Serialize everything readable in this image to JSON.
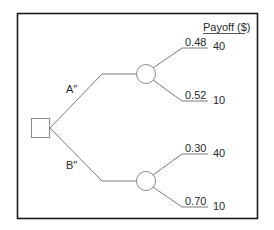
{
  "diagram": {
    "type": "decision-tree",
    "payoff_header": "Payoff ($)",
    "decision_node": {
      "shape": "square"
    },
    "alternatives": [
      {
        "label": "A″",
        "chance_node": {
          "shape": "circle"
        },
        "outcomes": [
          {
            "probability": "0.48",
            "payoff": "40"
          },
          {
            "probability": "0.52",
            "payoff": "10"
          }
        ]
      },
      {
        "label": "B″",
        "chance_node": {
          "shape": "circle"
        },
        "outcomes": [
          {
            "probability": "0.30",
            "payoff": "40"
          },
          {
            "probability": "0.70",
            "payoff": "10"
          }
        ]
      }
    ],
    "colors": {
      "border": "#1a1a1a",
      "lines": "#7a7a7a",
      "text": "#2a2a2a"
    }
  }
}
